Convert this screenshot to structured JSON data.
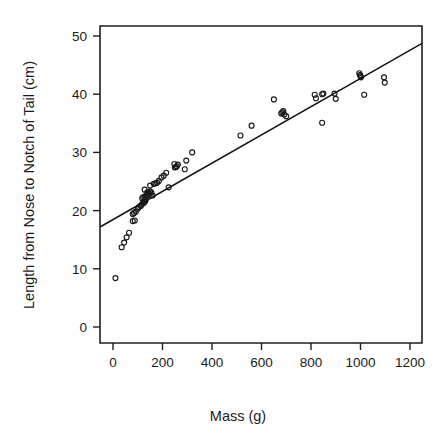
{
  "chart_data": {
    "type": "scatter",
    "title": "",
    "xlabel": "Mass (g)",
    "ylabel": "Length from Nose to Notch of Tail (cm)",
    "xlim": [
      -60,
      1260
    ],
    "ylim": [
      -2,
      52
    ],
    "xticks": [
      0,
      200,
      400,
      600,
      800,
      1000,
      1200
    ],
    "yticks": [
      0,
      10,
      20,
      30,
      40,
      50
    ],
    "xtick_labels": [
      "0",
      "200",
      "400",
      "600",
      "800",
      "1000",
      "1200"
    ],
    "ytick_labels": [
      "0",
      "10",
      "20",
      "30",
      "40",
      "50"
    ],
    "grid": false,
    "legend": false,
    "legend_position": "none",
    "series": [
      {
        "name": "Specimens",
        "marker": "open-circle",
        "color": "#1a1a1a",
        "points": [
          [
            10,
            8.4
          ],
          [
            35,
            13.7
          ],
          [
            45,
            14.5
          ],
          [
            55,
            15.4
          ],
          [
            65,
            16.2
          ],
          [
            80,
            18.2
          ],
          [
            88,
            18.3
          ],
          [
            80,
            19.4
          ],
          [
            85,
            19.6
          ],
          [
            92,
            19.8
          ],
          [
            100,
            20.3
          ],
          [
            105,
            20.6
          ],
          [
            112,
            20.8
          ],
          [
            115,
            21.0
          ],
          [
            120,
            21.2
          ],
          [
            124,
            21.3
          ],
          [
            126,
            21.5
          ],
          [
            130,
            21.6
          ],
          [
            132,
            21.8
          ],
          [
            118,
            22.1
          ],
          [
            122,
            22.3
          ],
          [
            128,
            22.4
          ],
          [
            133,
            22.5
          ],
          [
            136,
            22.6
          ],
          [
            140,
            22.7
          ],
          [
            144,
            22.8
          ],
          [
            148,
            22.9
          ],
          [
            138,
            23.1
          ],
          [
            142,
            23.2
          ],
          [
            150,
            23.3
          ],
          [
            128,
            23.6
          ],
          [
            155,
            23.1
          ],
          [
            160,
            22.6
          ],
          [
            150,
            24.3
          ],
          [
            165,
            24.6
          ],
          [
            172,
            24.7
          ],
          [
            178,
            24.8
          ],
          [
            185,
            25.1
          ],
          [
            196,
            25.7
          ],
          [
            205,
            26.0
          ],
          [
            215,
            26.5
          ],
          [
            225,
            24.0
          ],
          [
            250,
            27.4
          ],
          [
            254,
            27.5
          ],
          [
            258,
            27.6
          ],
          [
            262,
            27.9
          ],
          [
            248,
            28.0
          ],
          [
            290,
            27.1
          ],
          [
            296,
            28.6
          ],
          [
            320,
            30.0
          ],
          [
            515,
            32.9
          ],
          [
            560,
            34.6
          ],
          [
            650,
            39.1
          ],
          [
            680,
            36.7
          ],
          [
            684,
            36.9
          ],
          [
            688,
            37.1
          ],
          [
            692,
            36.5
          ],
          [
            700,
            36.2
          ],
          [
            815,
            39.9
          ],
          [
            820,
            39.3
          ],
          [
            845,
            40.0
          ],
          [
            850,
            40.1
          ],
          [
            845,
            35.1
          ],
          [
            895,
            40.1
          ],
          [
            900,
            39.2
          ],
          [
            995,
            43.6
          ],
          [
            998,
            43.3
          ],
          [
            1000,
            43.1
          ],
          [
            1002,
            42.9
          ],
          [
            1015,
            39.9
          ],
          [
            1095,
            42.9
          ],
          [
            1098,
            42.0
          ]
        ]
      }
    ],
    "fit_line": {
      "name": "least-squares fit",
      "x_start": -60,
      "y_start": 17.0,
      "x_end": 1260,
      "y_end": 49.0
    }
  }
}
